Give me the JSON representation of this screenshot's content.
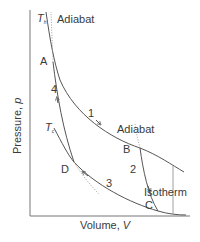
{
  "diagram": {
    "type": "Carnot cycle p-V diagram",
    "axes": {
      "x_label": "Volume, ",
      "x_var": "V",
      "y_label": "Pressure, ",
      "y_var": "p"
    },
    "isotherms": {
      "hot": {
        "symbol": "T",
        "subscript": "h"
      },
      "cold": {
        "symbol": "T",
        "subscript": "c"
      },
      "label": "Isotherm"
    },
    "adiabats": [
      {
        "label": "Adiabat",
        "position": "top"
      },
      {
        "label": "Adiabat",
        "position": "middle"
      }
    ],
    "points": [
      "A",
      "B",
      "C",
      "D"
    ],
    "steps": [
      "1",
      "2",
      "3",
      "4"
    ],
    "colors": {
      "line": "#555555",
      "dotted": "#999999",
      "text": "#3a3a3a",
      "background": "#ffffff"
    }
  }
}
